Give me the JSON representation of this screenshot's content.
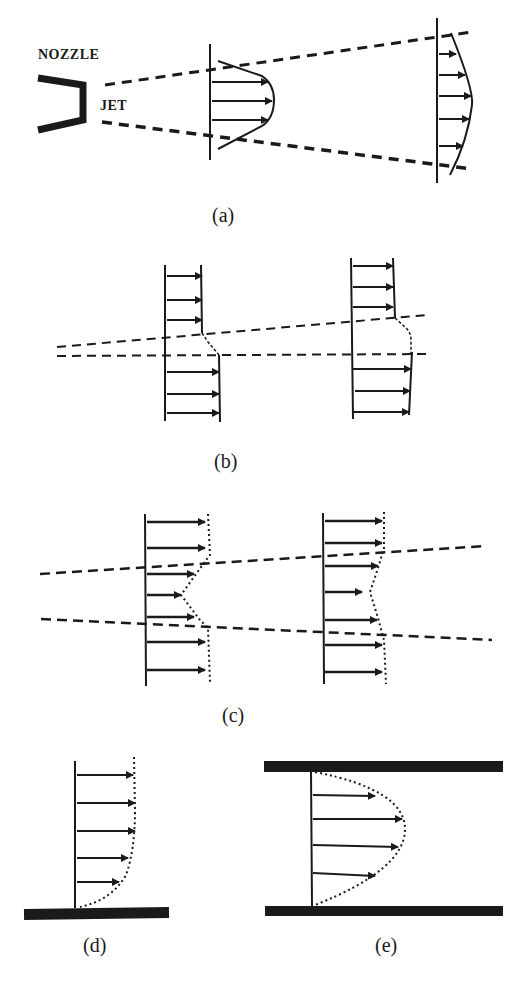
{
  "figure": {
    "panels": [
      {
        "id": "a",
        "caption": "(a)",
        "description": "Free jet issuing from nozzle; spreading velocity profiles",
        "labels": {
          "nozzle": "NOZZLE",
          "jet": "JET"
        }
      },
      {
        "id": "b",
        "caption": "(b)",
        "description": "Shear layer between two uniform streams of different velocity"
      },
      {
        "id": "c",
        "caption": "(c)",
        "description": "Wake velocity deficit profile widening downstream"
      },
      {
        "id": "d",
        "caption": "(d)",
        "description": "Boundary layer profile over a flat wall"
      },
      {
        "id": "e",
        "caption": "(e)",
        "description": "Parabolic channel flow profile between two walls"
      }
    ],
    "colors": {
      "ink": "#1a1a1a",
      "background": "#ffffff"
    }
  }
}
